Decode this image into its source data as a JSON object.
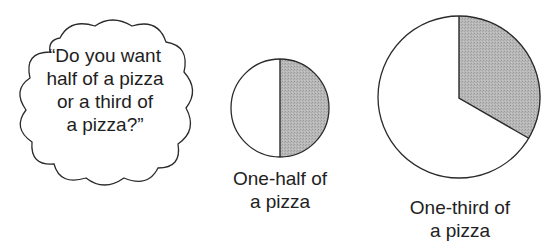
{
  "speech_bubble": {
    "lines": [
      "“Do you want",
      "half of a pizza",
      "or a third of",
      "a pizza?”"
    ]
  },
  "figures": [
    {
      "id": "half",
      "shaded_fraction": 0.5,
      "label_lines": [
        "One-half of",
        "a pizza"
      ]
    },
    {
      "id": "third",
      "shaded_fraction": 0.3333,
      "label_lines": [
        "One-third of",
        "a pizza"
      ]
    }
  ],
  "colors": {
    "outline": "#2a2a2a",
    "shade": "#b3b3b3",
    "fill": "#ffffff"
  }
}
